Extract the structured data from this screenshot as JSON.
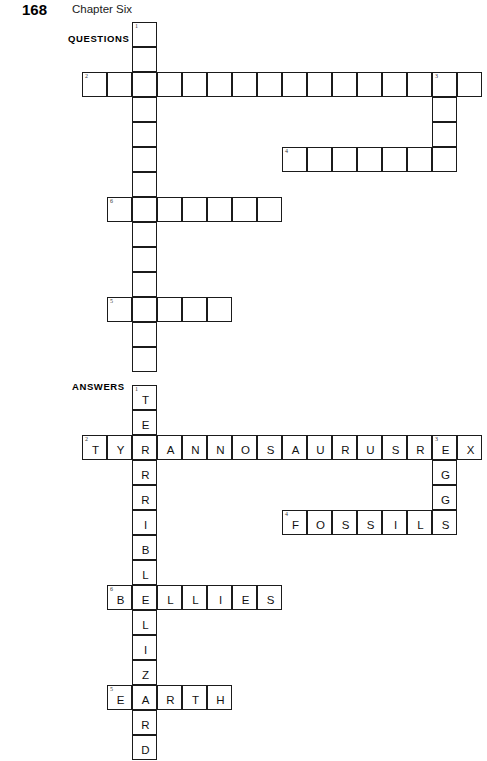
{
  "page": {
    "folio": "168",
    "chapter_title": "Chapter Six",
    "width": 487,
    "height": 733
  },
  "sections": {
    "questions_label": "QUESTIONS",
    "answers_label": "ANSWERS"
  },
  "grid_geometry": {
    "cell_size": 25,
    "origin_x": 82,
    "questions_origin_y": 22,
    "answers_origin_y": 385,
    "border_color": "#1b1b1b",
    "cell_fill": "#ffffff"
  },
  "entries": [
    {
      "number": "1",
      "direction": "down",
      "answer": "TERRIBLELIZARD",
      "length": 14,
      "col": 2,
      "row": 0
    },
    {
      "number": "2",
      "direction": "across",
      "answer": "TYRANNOSAURUSREX",
      "length": 16,
      "col": 0,
      "row": 2
    },
    {
      "number": "3",
      "direction": "down",
      "answer": "EGGS",
      "length": 4,
      "col": 14,
      "row": 2
    },
    {
      "number": "4",
      "direction": "across",
      "answer": "FOSSILS",
      "length": 7,
      "col": 8,
      "row": 5
    },
    {
      "number": "6",
      "direction": "across",
      "answer": "BELLIES",
      "length": 7,
      "col": 1,
      "row": 7
    },
    {
      "number": "5",
      "direction": "across",
      "answer": "EARTH",
      "length": 5,
      "col": 1,
      "row": 11
    }
  ],
  "questions_grid": {
    "show_letters": false,
    "cells": [
      {
        "col": 2,
        "row": 0,
        "num": "1"
      },
      {
        "col": 2,
        "row": 1,
        "num": ""
      },
      {
        "col": 0,
        "row": 2,
        "num": "2"
      },
      {
        "col": 1,
        "row": 2,
        "num": ""
      },
      {
        "col": 2,
        "row": 2,
        "num": ""
      },
      {
        "col": 3,
        "row": 2,
        "num": ""
      },
      {
        "col": 4,
        "row": 2,
        "num": ""
      },
      {
        "col": 5,
        "row": 2,
        "num": ""
      },
      {
        "col": 6,
        "row": 2,
        "num": ""
      },
      {
        "col": 7,
        "row": 2,
        "num": ""
      },
      {
        "col": 8,
        "row": 2,
        "num": ""
      },
      {
        "col": 9,
        "row": 2,
        "num": ""
      },
      {
        "col": 10,
        "row": 2,
        "num": ""
      },
      {
        "col": 11,
        "row": 2,
        "num": ""
      },
      {
        "col": 12,
        "row": 2,
        "num": ""
      },
      {
        "col": 13,
        "row": 2,
        "num": ""
      },
      {
        "col": 14,
        "row": 2,
        "num": "3"
      },
      {
        "col": 15,
        "row": 2,
        "num": ""
      },
      {
        "col": 2,
        "row": 3,
        "num": ""
      },
      {
        "col": 14,
        "row": 3,
        "num": ""
      },
      {
        "col": 2,
        "row": 4,
        "num": ""
      },
      {
        "col": 14,
        "row": 4,
        "num": ""
      },
      {
        "col": 8,
        "row": 5,
        "num": "4"
      },
      {
        "col": 9,
        "row": 5,
        "num": ""
      },
      {
        "col": 10,
        "row": 5,
        "num": ""
      },
      {
        "col": 11,
        "row": 5,
        "num": ""
      },
      {
        "col": 12,
        "row": 5,
        "num": ""
      },
      {
        "col": 13,
        "row": 5,
        "num": ""
      },
      {
        "col": 14,
        "row": 5,
        "num": ""
      },
      {
        "col": 2,
        "row": 5,
        "num": ""
      },
      {
        "col": 2,
        "row": 6,
        "num": ""
      },
      {
        "col": 1,
        "row": 7,
        "num": "6"
      },
      {
        "col": 2,
        "row": 7,
        "num": ""
      },
      {
        "col": 3,
        "row": 7,
        "num": ""
      },
      {
        "col": 4,
        "row": 7,
        "num": ""
      },
      {
        "col": 5,
        "row": 7,
        "num": ""
      },
      {
        "col": 6,
        "row": 7,
        "num": ""
      },
      {
        "col": 7,
        "row": 7,
        "num": ""
      },
      {
        "col": 2,
        "row": 8,
        "num": ""
      },
      {
        "col": 2,
        "row": 9,
        "num": ""
      },
      {
        "col": 2,
        "row": 10,
        "num": ""
      },
      {
        "col": 1,
        "row": 11,
        "num": "5"
      },
      {
        "col": 2,
        "row": 11,
        "num": ""
      },
      {
        "col": 3,
        "row": 11,
        "num": ""
      },
      {
        "col": 4,
        "row": 11,
        "num": ""
      },
      {
        "col": 5,
        "row": 11,
        "num": ""
      },
      {
        "col": 2,
        "row": 12,
        "num": ""
      },
      {
        "col": 2,
        "row": 13,
        "num": ""
      }
    ]
  },
  "answers_grid": {
    "show_letters": true,
    "cells": [
      {
        "col": 2,
        "row": 0,
        "num": "1",
        "letter": "T"
      },
      {
        "col": 2,
        "row": 1,
        "num": "",
        "letter": "E"
      },
      {
        "col": 0,
        "row": 2,
        "num": "2",
        "letter": "T"
      },
      {
        "col": 1,
        "row": 2,
        "num": "",
        "letter": "Y"
      },
      {
        "col": 2,
        "row": 2,
        "num": "",
        "letter": "R"
      },
      {
        "col": 3,
        "row": 2,
        "num": "",
        "letter": "A"
      },
      {
        "col": 4,
        "row": 2,
        "num": "",
        "letter": "N"
      },
      {
        "col": 5,
        "row": 2,
        "num": "",
        "letter": "N"
      },
      {
        "col": 6,
        "row": 2,
        "num": "",
        "letter": "O"
      },
      {
        "col": 7,
        "row": 2,
        "num": "",
        "letter": "S"
      },
      {
        "col": 8,
        "row": 2,
        "num": "",
        "letter": "A"
      },
      {
        "col": 9,
        "row": 2,
        "num": "",
        "letter": "U"
      },
      {
        "col": 10,
        "row": 2,
        "num": "",
        "letter": "R"
      },
      {
        "col": 11,
        "row": 2,
        "num": "",
        "letter": "U"
      },
      {
        "col": 12,
        "row": 2,
        "num": "",
        "letter": "S"
      },
      {
        "col": 13,
        "row": 2,
        "num": "",
        "letter": "R"
      },
      {
        "col": 14,
        "row": 2,
        "num": "3",
        "letter": "E"
      },
      {
        "col": 15,
        "row": 2,
        "num": "",
        "letter": "X"
      },
      {
        "col": 2,
        "row": 3,
        "num": "",
        "letter": "R"
      },
      {
        "col": 14,
        "row": 3,
        "num": "",
        "letter": "G"
      },
      {
        "col": 2,
        "row": 4,
        "num": "",
        "letter": "R"
      },
      {
        "col": 14,
        "row": 4,
        "num": "",
        "letter": "G"
      },
      {
        "col": 8,
        "row": 5,
        "num": "4",
        "letter": "F"
      },
      {
        "col": 9,
        "row": 5,
        "num": "",
        "letter": "O"
      },
      {
        "col": 10,
        "row": 5,
        "num": "",
        "letter": "S"
      },
      {
        "col": 11,
        "row": 5,
        "num": "",
        "letter": "S"
      },
      {
        "col": 12,
        "row": 5,
        "num": "",
        "letter": "I"
      },
      {
        "col": 13,
        "row": 5,
        "num": "",
        "letter": "L"
      },
      {
        "col": 14,
        "row": 5,
        "num": "",
        "letter": "S"
      },
      {
        "col": 2,
        "row": 5,
        "num": "",
        "letter": "I"
      },
      {
        "col": 2,
        "row": 6,
        "num": "",
        "letter": "B"
      },
      {
        "col": 2,
        "row": 7,
        "num": "",
        "letter": "L"
      },
      {
        "col": 1,
        "row": 8,
        "num": "6",
        "letter": "B"
      },
      {
        "col": 2,
        "row": 8,
        "num": "",
        "letter": "E"
      },
      {
        "col": 3,
        "row": 8,
        "num": "",
        "letter": "L"
      },
      {
        "col": 4,
        "row": 8,
        "num": "",
        "letter": "L"
      },
      {
        "col": 5,
        "row": 8,
        "num": "",
        "letter": "I"
      },
      {
        "col": 6,
        "row": 8,
        "num": "",
        "letter": "E"
      },
      {
        "col": 7,
        "row": 8,
        "num": "",
        "letter": "S"
      },
      {
        "col": 2,
        "row": 9,
        "num": "",
        "letter": "L"
      },
      {
        "col": 2,
        "row": 10,
        "num": "",
        "letter": "I"
      },
      {
        "col": 2,
        "row": 11,
        "num": "",
        "letter": "Z"
      },
      {
        "col": 1,
        "row": 12,
        "num": "5",
        "letter": "E"
      },
      {
        "col": 2,
        "row": 12,
        "num": "",
        "letter": "A"
      },
      {
        "col": 3,
        "row": 12,
        "num": "",
        "letter": "R"
      },
      {
        "col": 4,
        "row": 12,
        "num": "",
        "letter": "T"
      },
      {
        "col": 5,
        "row": 12,
        "num": "",
        "letter": "H"
      },
      {
        "col": 2,
        "row": 13,
        "num": "",
        "letter": "R"
      },
      {
        "col": 2,
        "row": 14,
        "num": "",
        "letter": "D"
      }
    ]
  },
  "labels": {
    "questions_x": 68,
    "questions_y": 33,
    "answers_x": 72,
    "answers_y": 381
  }
}
